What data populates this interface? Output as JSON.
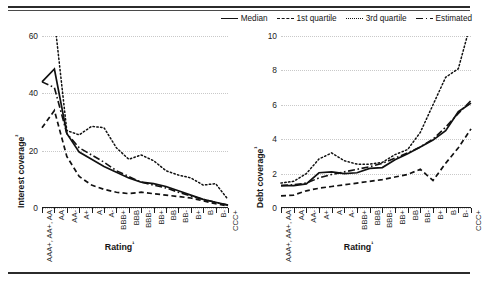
{
  "legend": {
    "items": [
      {
        "label": "Median",
        "style": "solid"
      },
      {
        "label": "1st quartile",
        "style": "dashed"
      },
      {
        "label": "3rd quartile",
        "style": "dotted"
      },
      {
        "label": "Estimated",
        "style": "dash-dot"
      }
    ]
  },
  "chart_data": [
    {
      "type": "line",
      "title": "Interest coverage by rating",
      "xlabel": "Rating¹",
      "ylabel": "Interest coverage²",
      "ylim": [
        0,
        60
      ],
      "yticks": [
        0,
        20,
        40,
        60
      ],
      "grid": true,
      "legend_position": "top-right",
      "categories": [
        "AAA+, AA+, AA",
        "AA",
        "AA-",
        "A+",
        "A",
        "A-",
        "BBB+",
        "BBB",
        "BBB-",
        "BB+",
        "BB",
        "BB-",
        "B+",
        "B",
        "B-",
        "CCC+"
      ],
      "series": [
        {
          "name": "Median",
          "values": [
            44.0,
            48.5,
            26.0,
            19.5,
            17.0,
            14.5,
            12.5,
            10.5,
            9.0,
            8.5,
            7.5,
            6.0,
            4.5,
            3.0,
            2.0,
            1.0
          ]
        },
        {
          "name": "1st quartile",
          "values": [
            28.0,
            34.0,
            18.0,
            11.0,
            8.0,
            6.5,
            5.5,
            5.0,
            5.5,
            5.0,
            4.5,
            4.0,
            3.5,
            2.5,
            1.5,
            0.7
          ]
        },
        {
          "name": "3rd quartile",
          "values": [
            68.0,
            66.0,
            27.0,
            25.5,
            28.5,
            28.0,
            21.0,
            17.0,
            18.5,
            16.5,
            13.0,
            11.5,
            10.5,
            8.0,
            8.5,
            3.0
          ]
        },
        {
          "name": "Estimated",
          "values": [
            44.0,
            42.0,
            26.0,
            21.0,
            18.5,
            16.0,
            13.0,
            11.0,
            9.0,
            8.0,
            7.0,
            5.5,
            4.2,
            3.0,
            2.0,
            1.0
          ]
        }
      ]
    },
    {
      "type": "line",
      "title": "Debt coverage by rating",
      "xlabel": "Rating¹",
      "ylabel": "Debt coverage³",
      "ylim": [
        0,
        10
      ],
      "yticks": [
        0,
        2,
        4,
        6,
        8,
        10
      ],
      "grid": true,
      "legend_position": "top-right",
      "categories": [
        "AAA+, AA+, AA",
        "AA",
        "AA-",
        "A+",
        "A",
        "A-",
        "BBB+",
        "BBB",
        "BBB-",
        "BB+",
        "BB",
        "BB-",
        "B+",
        "B",
        "B-",
        "CCC+"
      ],
      "series": [
        {
          "name": "Median",
          "values": [
            1.3,
            1.3,
            1.4,
            2.05,
            2.1,
            2.0,
            2.05,
            2.3,
            2.35,
            2.8,
            3.15,
            3.55,
            3.95,
            4.5,
            5.6,
            6.1
          ]
        },
        {
          "name": "1st quartile",
          "values": [
            0.7,
            0.75,
            1.0,
            1.15,
            1.25,
            1.35,
            1.45,
            1.55,
            1.65,
            1.8,
            1.95,
            2.25,
            1.6,
            2.6,
            3.5,
            4.6
          ]
        },
        {
          "name": "3rd quartile",
          "values": [
            1.45,
            1.55,
            2.0,
            2.85,
            3.2,
            2.75,
            2.55,
            2.55,
            2.65,
            3.1,
            3.4,
            4.4,
            6.0,
            7.6,
            8.1,
            10.8
          ]
        },
        {
          "name": "Estimated",
          "values": [
            1.3,
            1.35,
            1.45,
            1.75,
            1.95,
            2.1,
            2.25,
            2.4,
            2.6,
            2.9,
            3.2,
            3.55,
            4.0,
            4.7,
            5.5,
            6.25
          ]
        }
      ]
    }
  ]
}
